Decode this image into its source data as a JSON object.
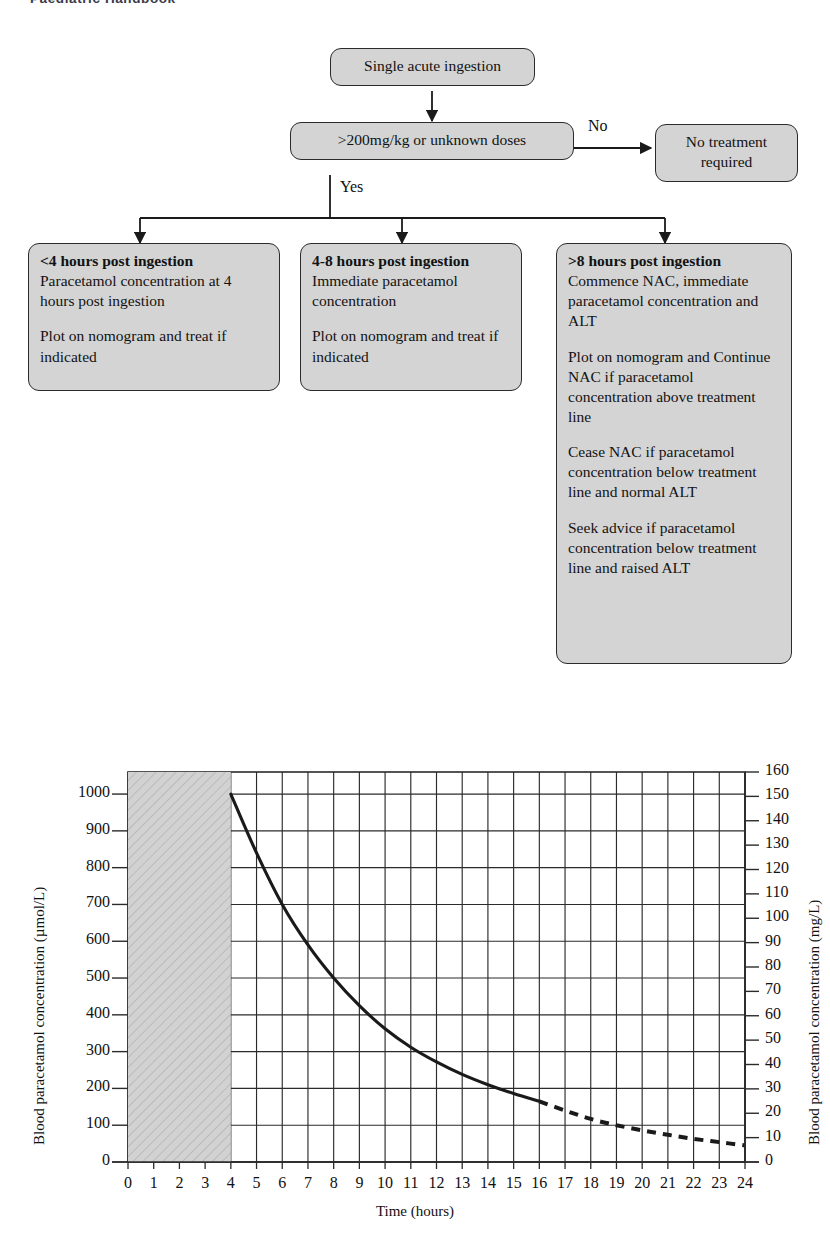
{
  "header": {
    "running_title": "Paediatric Handbook"
  },
  "flowchart": {
    "nodes": [
      {
        "id": "single-acute-ingestion",
        "title": "Single acute ingestion",
        "lines": []
      },
      {
        "id": "dose-threshold",
        "title": ">200mg/kg or unknown doses",
        "lines": []
      },
      {
        "id": "no-treatment",
        "title": "No treatment",
        "title2": "required",
        "lines": []
      },
      {
        "id": "under-4-hours",
        "heading": "<4 hours post ingestion",
        "para1": "Paracetamol concentration at 4 hours post ingestion",
        "para2": "Plot on nomogram and treat if indicated"
      },
      {
        "id": "four-to-eight-hours",
        "heading": "4-8 hours post ingestion",
        "para1": "Immediate paracetamol concentration",
        "para2": "Plot on nomogram and treat if indicated"
      },
      {
        "id": "over-8-hours",
        "heading": ">8 hours post ingestion",
        "para1": "Commence NAC, immediate paracetamol concentration and ALT",
        "para2": "Plot on nomogram and Continue NAC if paracetamol concentration above treatment line",
        "para3": "Cease NAC if paracetamol concentration below treatment line and normal ALT",
        "para4": "Seek advice if paracetamol concentration below treatment line and raised ALT"
      }
    ],
    "edge_labels": {
      "no": "No",
      "yes": "Yes"
    }
  },
  "chart_data": {
    "type": "line",
    "title": "",
    "xlabel": "Time (hours)",
    "ylabel": "Blood paracetamol concentration (µmol/L)",
    "ylabel_right": "Blood paracetamol concentration (mg/L)",
    "xlim": [
      0,
      24
    ],
    "ylim": [
      0,
      1060
    ],
    "ylim_right": [
      0,
      160
    ],
    "grid": true,
    "legend": "none",
    "x_ticks": [
      0,
      1,
      2,
      3,
      4,
      5,
      6,
      7,
      8,
      9,
      10,
      11,
      12,
      13,
      14,
      15,
      16,
      17,
      18,
      19,
      20,
      21,
      22,
      23,
      24
    ],
    "y_ticks_left": [
      0,
      100,
      200,
      300,
      400,
      500,
      600,
      700,
      800,
      900,
      1000
    ],
    "y_ticks_right": [
      0,
      10,
      20,
      30,
      40,
      50,
      60,
      70,
      80,
      90,
      100,
      110,
      120,
      130,
      140,
      150,
      160
    ],
    "shaded_region": {
      "label": "",
      "x_start": 0,
      "x_end": 4,
      "hatched": true,
      "color": "#d0d0d0"
    },
    "series": [
      {
        "name": "Treatment line (solid)",
        "style": "solid",
        "x": [
          4,
          5,
          6,
          7,
          8,
          9,
          10,
          11,
          12,
          13,
          14,
          15,
          16
        ],
        "values": [
          1000,
          840,
          700,
          590,
          500,
          425,
          362,
          312,
          272,
          238,
          210,
          186,
          165
        ]
      },
      {
        "name": "Treatment line (extrapolated, dashed)",
        "style": "dashed",
        "x": [
          16,
          17,
          18,
          19,
          20,
          21,
          22,
          23,
          24
        ],
        "values": [
          165,
          140,
          117,
          100,
          86,
          74,
          63,
          54,
          45
        ]
      }
    ]
  }
}
